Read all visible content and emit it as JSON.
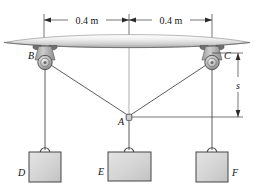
{
  "figure": {
    "name": "three-pulley-cable-system"
  },
  "dimensions": {
    "left_span": "0.4 m",
    "right_span": "0.4 m",
    "vertical_drop": "s"
  },
  "labels": {
    "pulley_left": "B",
    "pulley_right": "C",
    "ring": "A",
    "block_left": "D",
    "block_center": "E",
    "block_right": "F"
  },
  "colors": {
    "ink": "#1a1a1a",
    "line": "#555555",
    "block_fill": "#d6d6d6",
    "block_stroke": "#4a4a4a",
    "ceiling_light": "#f2f2f2",
    "ceiling_mid": "#d9d9d9",
    "ceiling_dark": "#a8a8a8",
    "pulley_fill": "#bdbdbd"
  }
}
